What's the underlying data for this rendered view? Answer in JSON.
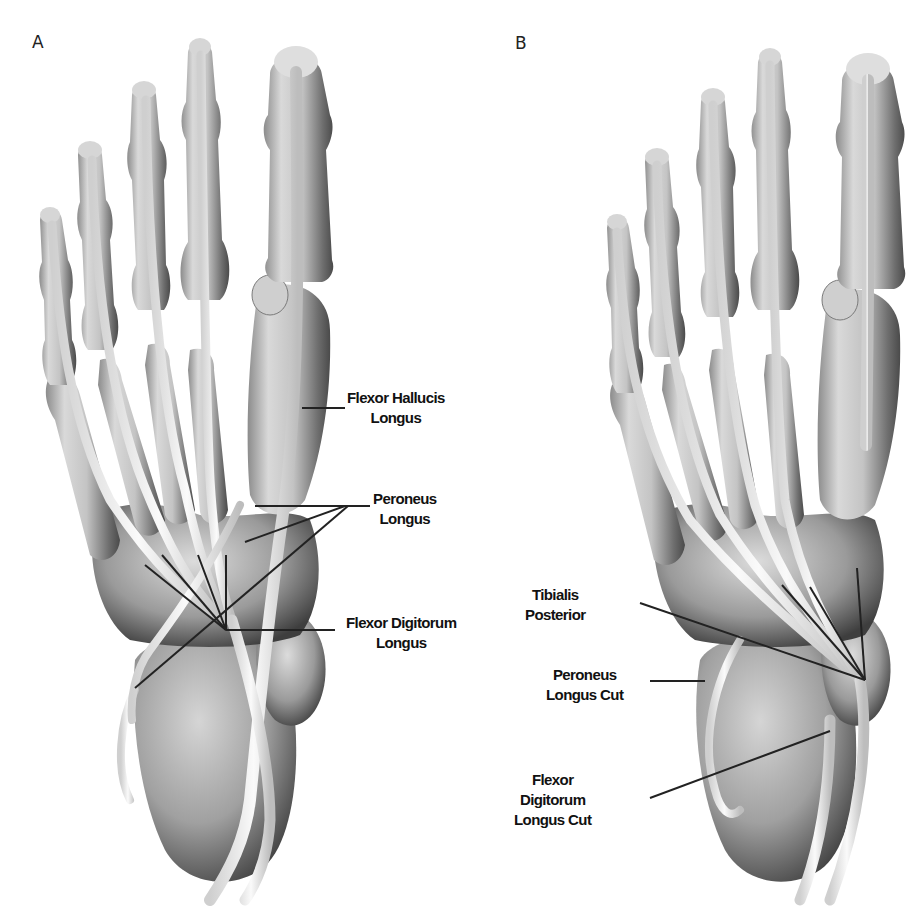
{
  "figure": {
    "panels": [
      {
        "id": "A",
        "letter": "A",
        "labels": [
          {
            "key": "flexor_hallucis_longus",
            "lines": [
              "Flexor Hallucis",
              "Longus"
            ]
          },
          {
            "key": "peroneus_longus",
            "lines": [
              "Peroneus",
              "Longus"
            ]
          },
          {
            "key": "flexor_digitorum_longus",
            "lines": [
              "Flexor Digitorum",
              "Longus"
            ]
          }
        ]
      },
      {
        "id": "B",
        "letter": "B",
        "labels": [
          {
            "key": "tibialis_posterior",
            "lines": [
              "Tibialis",
              "Posterior"
            ]
          },
          {
            "key": "peroneus_longus_cut",
            "lines": [
              "Peroneus",
              "Longus Cut"
            ]
          },
          {
            "key": "flexor_digitorum_longus_cut",
            "lines": [
              "Flexor",
              "Digitorum",
              "Longus Cut"
            ]
          }
        ]
      }
    ],
    "colors": {
      "background": "#ffffff",
      "bone_light": "#e6e6e6",
      "bone_mid": "#b5b5b5",
      "bone_dark": "#5a5a5a",
      "tendon": "#f2f2f2",
      "leader_line": "#222222",
      "text": "#111111"
    }
  }
}
